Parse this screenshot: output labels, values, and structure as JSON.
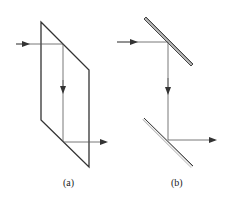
{
  "diagram": {
    "panels": [
      {
        "id": "a",
        "label": "(a)",
        "description": "Parallelogram prism with ray entering from left, reflected down, exiting right",
        "shape": "parallelogram",
        "points": [
          [
            41,
            22
          ],
          [
            89,
            70
          ],
          [
            89,
            167
          ],
          [
            41,
            120
          ]
        ]
      },
      {
        "id": "b",
        "label": "(b)",
        "description": "Two parallel mirrors (periscope arrangement) with ray entering from left, reflected down, exiting right",
        "mirrors": [
          {
            "from": [
              146,
              17
            ],
            "to": [
              193,
              65
            ]
          },
          {
            "from": [
              144,
              118
            ],
            "to": [
              193,
              166
            ]
          }
        ]
      }
    ],
    "colors": {
      "stroke": "#333333",
      "ray": "#555555",
      "mirror_fill": "#bbbbbb"
    }
  }
}
